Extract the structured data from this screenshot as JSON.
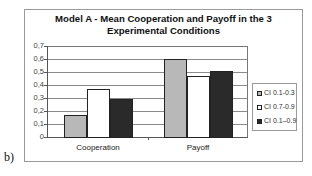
{
  "chart_data": {
    "type": "bar",
    "title": "Model A - Mean Cooperation and Payoff in the 3 Experimental Conditions",
    "title_lines": [
      "Model A - Mean Cooperation and Payoff in the 3",
      "Experimental Conditions"
    ],
    "categories": [
      "Cooperation",
      "Payoff"
    ],
    "series": [
      {
        "name": "CI 0.1-0.3",
        "color": "#b8b8b8",
        "values": [
          0.17,
          0.6
        ]
      },
      {
        "name": "CI 0.7-0.9",
        "color": "#ffffff",
        "values": [
          0.37,
          0.47
        ]
      },
      {
        "name": "CI 0.1–0.9",
        "color": "#2a2a2a",
        "values": [
          0.29,
          0.51
        ]
      }
    ],
    "xlabel": "",
    "ylabel": "",
    "ylim": [
      0,
      0.7
    ],
    "yticks": [
      "0",
      "0,1",
      "0,2",
      "0,3",
      "0,4",
      "0,5",
      "0,6",
      "0,7"
    ],
    "grid": true,
    "legend_position": "right"
  },
  "panel_label": "b)"
}
